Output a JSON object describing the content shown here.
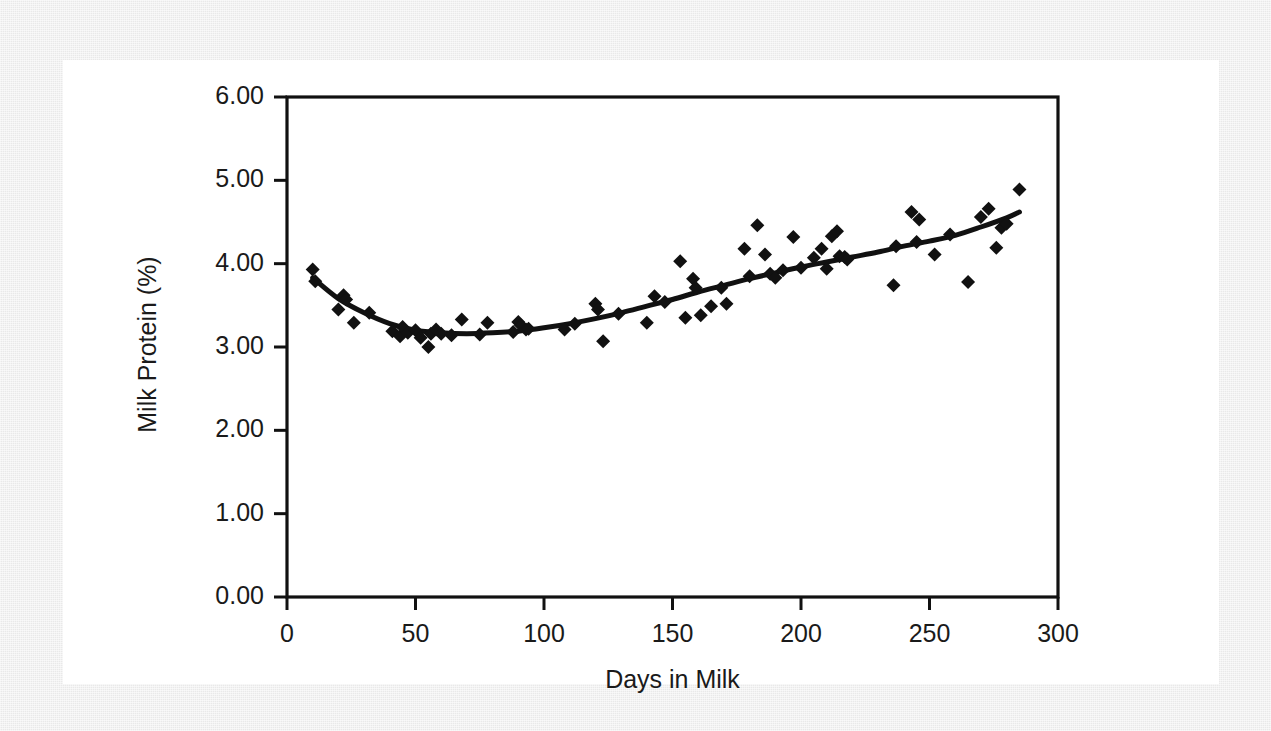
{
  "figure": {
    "background_color": "#ffffff",
    "page_color": "#e9e9e9",
    "ink_color": "#111111"
  },
  "chart_data": {
    "type": "scatter",
    "title": "",
    "xlabel": "Days in Milk",
    "ylabel": "Milk Protein (%)",
    "xlim": [
      0,
      300
    ],
    "ylim": [
      0,
      6
    ],
    "xticks": [
      0,
      50,
      100,
      150,
      200,
      250,
      300
    ],
    "xtick_labels": [
      "0",
      "50",
      "100",
      "150",
      "200",
      "250",
      "300"
    ],
    "yticks": [
      0,
      1,
      2,
      3,
      4,
      5,
      6
    ],
    "ytick_labels": [
      "0.00",
      "1.00",
      "2.00",
      "3.00",
      "4.00",
      "5.00",
      "6.00"
    ],
    "grid": false,
    "legend": false,
    "marker": "diamond",
    "marker_color": "#111111",
    "marker_size": 11,
    "series": [
      {
        "name": "Milk protein observations",
        "type": "scatter",
        "points": [
          [
            10,
            3.93
          ],
          [
            11,
            3.79
          ],
          [
            20,
            3.45
          ],
          [
            22,
            3.62
          ],
          [
            23,
            3.57
          ],
          [
            26,
            3.29
          ],
          [
            32,
            3.41
          ],
          [
            41,
            3.19
          ],
          [
            44,
            3.13
          ],
          [
            45,
            3.24
          ],
          [
            47,
            3.17
          ],
          [
            50,
            3.2
          ],
          [
            52,
            3.11
          ],
          [
            55,
            3.0
          ],
          [
            56,
            3.16
          ],
          [
            58,
            3.21
          ],
          [
            60,
            3.16
          ],
          [
            64,
            3.14
          ],
          [
            68,
            3.33
          ],
          [
            75,
            3.15
          ],
          [
            78,
            3.29
          ],
          [
            88,
            3.18
          ],
          [
            90,
            3.3
          ],
          [
            91,
            3.26
          ],
          [
            93,
            3.21
          ],
          [
            94,
            3.22
          ],
          [
            108,
            3.21
          ],
          [
            112,
            3.28
          ],
          [
            120,
            3.52
          ],
          [
            121,
            3.45
          ],
          [
            123,
            3.07
          ],
          [
            129,
            3.4
          ],
          [
            140,
            3.29
          ],
          [
            143,
            3.61
          ],
          [
            147,
            3.54
          ],
          [
            153,
            4.03
          ],
          [
            155,
            3.35
          ],
          [
            158,
            3.82
          ],
          [
            159,
            3.71
          ],
          [
            161,
            3.38
          ],
          [
            165,
            3.49
          ],
          [
            169,
            3.71
          ],
          [
            171,
            3.52
          ],
          [
            178,
            4.18
          ],
          [
            180,
            3.85
          ],
          [
            183,
            4.46
          ],
          [
            186,
            4.11
          ],
          [
            188,
            3.88
          ],
          [
            190,
            3.83
          ],
          [
            193,
            3.92
          ],
          [
            197,
            4.32
          ],
          [
            200,
            3.95
          ],
          [
            205,
            4.07
          ],
          [
            208,
            4.18
          ],
          [
            210,
            3.94
          ],
          [
            212,
            4.33
          ],
          [
            214,
            4.39
          ],
          [
            215,
            4.09
          ],
          [
            217,
            4.08
          ],
          [
            218,
            4.05
          ],
          [
            236,
            3.74
          ],
          [
            237,
            4.21
          ],
          [
            243,
            4.62
          ],
          [
            245,
            4.26
          ],
          [
            246,
            4.53
          ],
          [
            252,
            4.11
          ],
          [
            258,
            4.35
          ],
          [
            265,
            3.78
          ],
          [
            270,
            4.56
          ],
          [
            273,
            4.66
          ],
          [
            276,
            4.19
          ],
          [
            278,
            4.43
          ],
          [
            280,
            4.48
          ],
          [
            285,
            4.89
          ]
        ]
      },
      {
        "name": "Fitted lactation curve",
        "type": "line",
        "color": "#111111",
        "line_width": 5,
        "points": [
          [
            10,
            3.83
          ],
          [
            20,
            3.58
          ],
          [
            30,
            3.41
          ],
          [
            40,
            3.28
          ],
          [
            50,
            3.2
          ],
          [
            60,
            3.17
          ],
          [
            70,
            3.16
          ],
          [
            80,
            3.17
          ],
          [
            90,
            3.19
          ],
          [
            100,
            3.23
          ],
          [
            110,
            3.28
          ],
          [
            120,
            3.34
          ],
          [
            130,
            3.41
          ],
          [
            140,
            3.49
          ],
          [
            150,
            3.57
          ],
          [
            160,
            3.66
          ],
          [
            170,
            3.74
          ],
          [
            180,
            3.82
          ],
          [
            190,
            3.89
          ],
          [
            200,
            3.96
          ],
          [
            210,
            4.02
          ],
          [
            220,
            4.08
          ],
          [
            230,
            4.14
          ],
          [
            240,
            4.21
          ],
          [
            250,
            4.27
          ],
          [
            260,
            4.34
          ],
          [
            270,
            4.44
          ],
          [
            280,
            4.55
          ],
          [
            285,
            4.62
          ]
        ]
      }
    ]
  }
}
